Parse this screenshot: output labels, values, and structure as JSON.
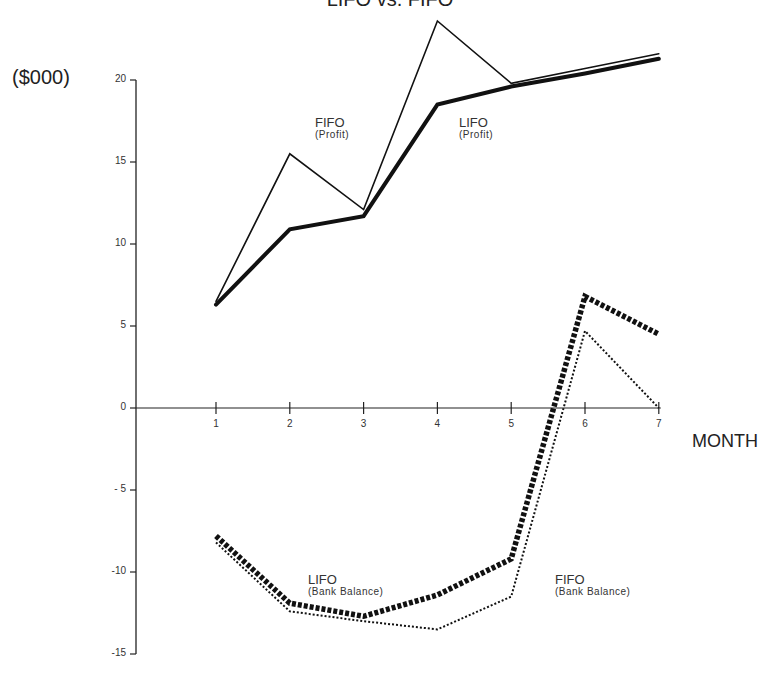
{
  "chart_data": {
    "type": "line",
    "title": "LIFO vs. FIFO",
    "xlabel": "MONTH",
    "ylabel": "($000)",
    "x": [
      1,
      2,
      3,
      4,
      5,
      6,
      7
    ],
    "ylim": [
      -15,
      23
    ],
    "yticks": [
      20,
      15,
      10,
      5,
      0,
      -5,
      -10,
      -15
    ],
    "ytick_labels": [
      "20",
      "15",
      "10",
      "5",
      "0",
      "- 5",
      "-10",
      "-15"
    ],
    "xtick_labels": [
      "1",
      "2",
      "3",
      "4",
      "5",
      "6",
      "7"
    ],
    "grid": false,
    "legend": "inline annotations",
    "series": [
      {
        "name": "FIFO (Profit)",
        "style": "thin solid",
        "values": [
          6.5,
          15.5,
          12.1,
          23.6,
          19.8,
          20.7,
          21.6
        ]
      },
      {
        "name": "LIFO (Profit)",
        "style": "thick solid",
        "values": [
          6.3,
          10.9,
          11.7,
          18.5,
          19.6,
          20.4,
          21.3
        ]
      },
      {
        "name": "LIFO (Bank Balance)",
        "style": "thick dotted",
        "values": [
          -7.8,
          -11.9,
          -12.7,
          -11.4,
          -9.2,
          6.8,
          4.5
        ]
      },
      {
        "name": "FIFO (Bank Balance)",
        "style": "thin dotted",
        "values": [
          -8.2,
          -12.4,
          -13.0,
          -13.5,
          -11.5,
          4.7,
          0.0
        ]
      }
    ]
  },
  "labels": {
    "title": "LIFO vs. FIFO",
    "unit": "($000)",
    "xaxis": "MONTH",
    "fifo_profit_main": "FIFO",
    "fifo_profit_sub": "(Profit)",
    "lifo_profit_main": "LIFO",
    "lifo_profit_sub": "(Profit)",
    "lifo_bank_main": "LIFO",
    "lifo_bank_sub": "(Bank  Balance)",
    "fifo_bank_main": "FIFO",
    "fifo_bank_sub": "(Bank  Balance)"
  }
}
